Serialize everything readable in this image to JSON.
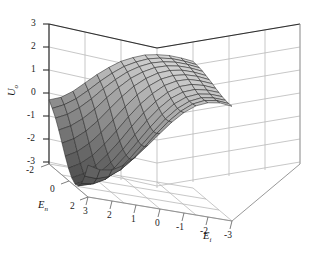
{
  "figure": {
    "background_color": "#ffffff",
    "plot_type": "3d-surface"
  },
  "chart_data": {
    "type": "surface",
    "title": "",
    "xlabel": "E_i",
    "ylabel": "E_n",
    "zlabel": "U_o",
    "grid": true,
    "legend": "none",
    "projection": "3d",
    "axes": {
      "z": {
        "label": "U",
        "label_sub": "o",
        "ticks": [
          3,
          2,
          1,
          0,
          -1,
          -2,
          -3
        ],
        "tick_labels": [
          "3",
          "2",
          "1",
          "0",
          "-1",
          "-2",
          "-3"
        ],
        "range": [
          -3,
          3
        ],
        "position": "left-vertical"
      },
      "y": {
        "label": "E",
        "label_sub": "n",
        "ticks": [
          -2,
          0,
          2
        ],
        "tick_labels": [
          "-2",
          "0",
          "2"
        ],
        "range": [
          -3,
          3
        ],
        "position": "bottom-left-depth"
      },
      "x": {
        "label": "E",
        "label_sub": "i",
        "ticks": [
          3,
          2,
          1,
          0,
          -1,
          -2,
          -3
        ],
        "tick_labels": [
          "3",
          "2",
          "1",
          "0",
          "-1",
          "-2",
          "-3"
        ],
        "range": [
          -3,
          3
        ],
        "position": "bottom-right"
      }
    },
    "surface": {
      "colormap": "gray",
      "shading": "faceted",
      "mesh_color": "#2b2b2b",
      "mesh_rows": 13,
      "mesh_cols": 13,
      "z_min": -3.0,
      "z_max": 2.6,
      "description": "Saddle-like surface: light-gray elevated plateau near z=2 across the back and right, descending steeply to a dark valley near z=-3 at the front-left corner, with a small rise at the far left edge near z=0.",
      "x": [
        -3,
        -2.5,
        -2,
        -1.5,
        -1,
        -0.5,
        0,
        0.5,
        1,
        1.5,
        2,
        2.5,
        3
      ],
      "y": [
        -3,
        -2.5,
        -2,
        -1.5,
        -1,
        -0.5,
        0,
        0.5,
        1,
        1.5,
        2,
        2.5,
        3
      ],
      "z": [
        [
          -0.3,
          -0.1,
          0.25,
          0.7,
          1.15,
          1.55,
          1.9,
          2.15,
          2.35,
          2.45,
          2.5,
          2.48,
          2.42
        ],
        [
          -0.55,
          -0.3,
          0.05,
          0.5,
          0.98,
          1.42,
          1.8,
          2.08,
          2.3,
          2.42,
          2.48,
          2.46,
          2.4
        ],
        [
          -0.85,
          -0.6,
          -0.22,
          0.25,
          0.78,
          1.26,
          1.68,
          2.0,
          2.24,
          2.38,
          2.45,
          2.44,
          2.38
        ],
        [
          -1.25,
          -0.98,
          -0.58,
          -0.08,
          0.5,
          1.04,
          1.52,
          1.88,
          2.16,
          2.32,
          2.4,
          2.4,
          2.34
        ],
        [
          -1.7,
          -1.42,
          -1.0,
          -0.46,
          0.16,
          0.76,
          1.3,
          1.72,
          2.04,
          2.24,
          2.34,
          2.34,
          2.28
        ],
        [
          -2.15,
          -1.86,
          -1.42,
          -0.86,
          -0.22,
          0.44,
          1.04,
          1.52,
          1.9,
          2.14,
          2.26,
          2.28,
          2.22
        ],
        [
          -2.55,
          -2.26,
          -1.82,
          -1.24,
          -0.58,
          0.12,
          0.76,
          1.3,
          1.74,
          2.02,
          2.18,
          2.2,
          2.16
        ],
        [
          -2.85,
          -2.58,
          -2.14,
          -1.56,
          -0.9,
          -0.18,
          0.5,
          1.08,
          1.56,
          1.9,
          2.08,
          2.12,
          2.08
        ],
        [
          -3.0,
          -2.76,
          -2.36,
          -1.8,
          -1.14,
          -0.42,
          0.28,
          0.9,
          1.42,
          1.78,
          1.98,
          2.04,
          2.02
        ],
        [
          -2.96,
          -2.8,
          -2.44,
          -1.92,
          -1.28,
          -0.58,
          0.12,
          0.76,
          1.3,
          1.68,
          1.9,
          1.98,
          1.96
        ],
        [
          -2.74,
          -2.66,
          -2.38,
          -1.92,
          -1.32,
          -0.64,
          0.04,
          0.68,
          1.22,
          1.62,
          1.86,
          1.94,
          1.92
        ],
        [
          -2.3,
          -2.32,
          -2.14,
          -1.76,
          -1.22,
          -0.58,
          0.08,
          0.7,
          1.22,
          1.62,
          1.86,
          1.94,
          1.9
        ],
        [
          -1.7,
          -1.82,
          -1.74,
          -1.44,
          -0.98,
          -0.4,
          0.2,
          0.78,
          1.28,
          1.66,
          1.88,
          1.96,
          1.9
        ]
      ]
    }
  },
  "z_axis": {
    "title_main": "U",
    "title_sub": "o",
    "tick_labels": [
      "3",
      "2",
      "1",
      "0",
      "-1",
      "-2",
      "-3"
    ]
  },
  "y_axis": {
    "title_main": "E",
    "title_sub": "n",
    "tick_labels": [
      "-2",
      "0",
      "2"
    ]
  },
  "x_axis": {
    "title_main": "E",
    "title_sub": "i",
    "tick_labels": [
      "3",
      "2",
      "1",
      "0",
      "-1",
      "-2",
      "-3"
    ]
  }
}
